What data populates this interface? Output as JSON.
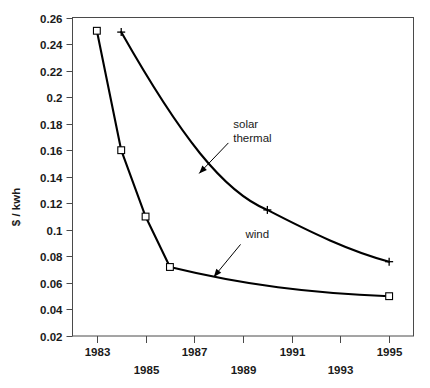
{
  "chart_data": {
    "type": "line",
    "title": "",
    "xlabel": "",
    "ylabel": "$ / kwh",
    "xlim": [
      1982,
      1996
    ],
    "ylim": [
      0.02,
      0.26
    ],
    "grid": false,
    "legend": "none (inline annotations with arrows)",
    "x_ticks": [
      1983,
      1985,
      1987,
      1989,
      1991,
      1993,
      1995
    ],
    "x_tick_labels": [
      "1983",
      "1985",
      "1987",
      "1989",
      "1991",
      "1993",
      "1995"
    ],
    "x_tick_label_rows": [
      "upper",
      "lower",
      "upper",
      "lower",
      "upper",
      "lower",
      "upper"
    ],
    "y_ticks": [
      0.02,
      0.04,
      0.06,
      0.08,
      0.1,
      0.12,
      0.14,
      0.16,
      0.18,
      0.2,
      0.22,
      0.24,
      0.26
    ],
    "y_tick_labels": [
      "0.02",
      "0.04",
      "0.06",
      "0.08",
      "0.1",
      "0.12",
      "0.14",
      "0.16",
      "0.18",
      "0.2",
      "0.22",
      "0.24",
      "0.26"
    ],
    "series": [
      {
        "name": "wind",
        "marker": "open-square",
        "color": "#000000",
        "x": [
          1983,
          1984,
          1985,
          1986,
          1995
        ],
        "values": [
          0.25,
          0.16,
          0.11,
          0.072,
          0.05
        ],
        "annotation": {
          "text": "wind",
          "text_x": 1989.1,
          "text_y": 0.0935,
          "arrow_from_x": 1988.9,
          "arrow_from_y": 0.089,
          "arrow_to_x": 1987.8,
          "arrow_to_y": 0.0645
        }
      },
      {
        "name": "solar thermal",
        "marker": "plus",
        "color": "#000000",
        "x": [
          1984,
          1990,
          1995
        ],
        "values": [
          0.249,
          0.115,
          0.076
        ],
        "annotation": {
          "text_line1": "solar",
          "text_line2": "thermal",
          "text_x": 1988.6,
          "text_y": 0.1765,
          "arrow_from_x": 1988.4,
          "arrow_from_y": 0.1655,
          "arrow_to_x": 1987.2,
          "arrow_to_y": 0.1425
        }
      }
    ]
  },
  "axis": {
    "y_title": "$ / kwh"
  }
}
